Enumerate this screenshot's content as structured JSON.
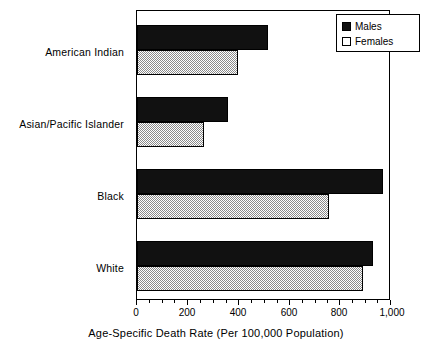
{
  "chart_data": {
    "type": "bar",
    "orientation": "horizontal",
    "title": "",
    "xlabel": "Age-Specific Death Rate (Per 100,000 Population)",
    "ylabel": "",
    "xlim": [
      0,
      1000
    ],
    "grid": false,
    "legend_position": "top-right",
    "categories": [
      "American Indian",
      "Asian/Pacific Islander",
      "Black",
      "White"
    ],
    "series": [
      {
        "name": "Males",
        "color": "#111111",
        "values": [
          520,
          360,
          975,
          935
        ]
      },
      {
        "name": "Females",
        "color": "#8a8a8a",
        "values": [
          400,
          265,
          760,
          895
        ]
      }
    ],
    "xticks": [
      {
        "value": 0,
        "label": "0"
      },
      {
        "value": 200,
        "label": "200"
      },
      {
        "value": 400,
        "label": "400"
      },
      {
        "value": 600,
        "label": "600"
      },
      {
        "value": 800,
        "label": "800"
      },
      {
        "value": 1000,
        "label": "1,000"
      }
    ],
    "xminor_ticks": [
      50,
      100,
      150,
      250,
      300,
      350,
      450,
      500,
      550,
      650,
      700,
      750,
      850,
      900,
      950
    ]
  },
  "legend": {
    "items": [
      {
        "label": "Males",
        "swatch": "filled-black-square"
      },
      {
        "label": "Females",
        "swatch": "empty-white-square"
      }
    ]
  },
  "axis": {
    "x_title": "Age-Specific Death Rate (Per 100,000 Population)"
  }
}
